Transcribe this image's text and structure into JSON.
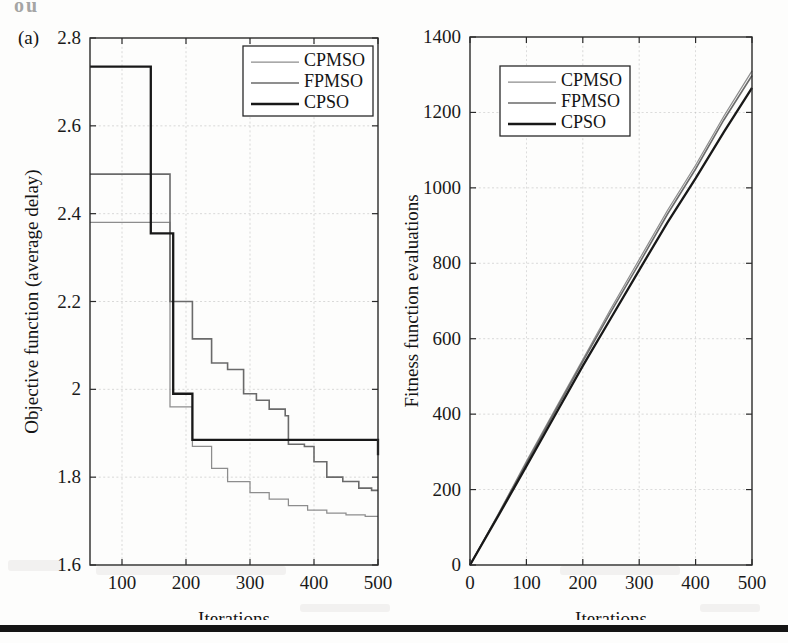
{
  "figure": {
    "panel_tag": "(a)",
    "top_bleed_text": "ou",
    "footer_rule_color": "#151515",
    "background_color": "#fdfdfc"
  },
  "colors": {
    "cpmso": "#8d8d8d",
    "fpmso": "#6a6a6a",
    "cpso": "#181818",
    "axis": "#2a2a2a",
    "grid": "#b9b9b9"
  },
  "legend": {
    "entries": [
      {
        "label": "CPMSO",
        "series": "cpmso"
      },
      {
        "label": "FPMSO",
        "series": "fpmso"
      },
      {
        "label": "CPSO",
        "series": "cpso"
      }
    ]
  },
  "chart_data": [
    {
      "id": "objective-convergence",
      "type": "line",
      "panel": "(a)",
      "title": "",
      "xlabel": "Iterations",
      "ylabel": "Objective function (average delay)",
      "xlim": [
        50,
        500
      ],
      "ylim": [
        1.6,
        2.8
      ],
      "xticks": [
        100,
        200,
        300,
        400,
        500
      ],
      "yticks": [
        1.6,
        1.8,
        2,
        2.2,
        2.4,
        2.6,
        2.8
      ],
      "ytick_labels": [
        "1.6",
        "1.8",
        "2",
        "2.2",
        "2.4",
        "2.6",
        "2.8"
      ],
      "xtick_labels": [
        "100",
        "200",
        "300",
        "400",
        "500"
      ],
      "grid": true,
      "legend_position": "top-right",
      "step": "post",
      "series": [
        {
          "name": "CPMSO",
          "x": [
            50,
            120,
            145,
            175,
            180,
            200,
            210,
            240,
            265,
            275,
            300,
            330,
            360,
            390,
            420,
            450,
            480,
            500
          ],
          "values": [
            2.38,
            2.38,
            2.38,
            1.96,
            1.96,
            1.96,
            1.87,
            1.82,
            1.79,
            1.79,
            1.765,
            1.75,
            1.735,
            1.725,
            1.718,
            1.714,
            1.711,
            1.711
          ]
        },
        {
          "name": "FPMSO",
          "x": [
            50,
            120,
            145,
            175,
            180,
            205,
            210,
            240,
            265,
            290,
            310,
            330,
            355,
            360,
            385,
            400,
            420,
            445,
            470,
            490,
            500
          ],
          "values": [
            2.49,
            2.49,
            2.49,
            2.2,
            2.2,
            2.2,
            2.115,
            2.06,
            2.045,
            1.99,
            1.975,
            1.955,
            1.94,
            1.875,
            1.87,
            1.835,
            1.8,
            1.79,
            1.775,
            1.77,
            1.77
          ]
        },
        {
          "name": "CPSO",
          "x": [
            50,
            120,
            125,
            145,
            150,
            175,
            180,
            205,
            210,
            240,
            500
          ],
          "values": [
            2.735,
            2.735,
            2.735,
            2.355,
            2.355,
            2.355,
            1.99,
            1.99,
            1.885,
            1.885,
            1.85
          ]
        }
      ]
    },
    {
      "id": "fitness-evaluations",
      "type": "line",
      "panel": "(b)",
      "title": "",
      "xlabel": "Iterations",
      "ylabel": "Fitness function evaluations",
      "xlim": [
        0,
        500
      ],
      "ylim": [
        0,
        1400
      ],
      "xticks": [
        0,
        100,
        200,
        300,
        400,
        500
      ],
      "yticks": [
        0,
        200,
        400,
        600,
        800,
        1000,
        1200,
        1400
      ],
      "ytick_labels": [
        "0",
        "200",
        "400",
        "600",
        "800",
        "1000",
        "1200",
        "1400"
      ],
      "xtick_labels": [
        "0",
        "100",
        "200",
        "300",
        "400",
        "500"
      ],
      "grid": true,
      "legend_position": "top-left",
      "step": "none",
      "series": [
        {
          "name": "CPMSO",
          "x": [
            0,
            50,
            100,
            150,
            200,
            250,
            300,
            350,
            400,
            450,
            500
          ],
          "values": [
            0,
            135,
            275,
            410,
            545,
            680,
            810,
            940,
            1060,
            1190,
            1310
          ]
        },
        {
          "name": "FPMSO",
          "x": [
            0,
            50,
            100,
            150,
            200,
            250,
            300,
            350,
            400,
            450,
            500
          ],
          "values": [
            0,
            133,
            270,
            405,
            540,
            672,
            800,
            930,
            1050,
            1180,
            1298
          ]
        },
        {
          "name": "CPSO",
          "x": [
            0,
            50,
            100,
            150,
            200,
            250,
            300,
            350,
            400,
            450,
            500
          ],
          "values": [
            0,
            130,
            262,
            395,
            528,
            655,
            782,
            908,
            1025,
            1148,
            1265
          ]
        }
      ]
    }
  ]
}
